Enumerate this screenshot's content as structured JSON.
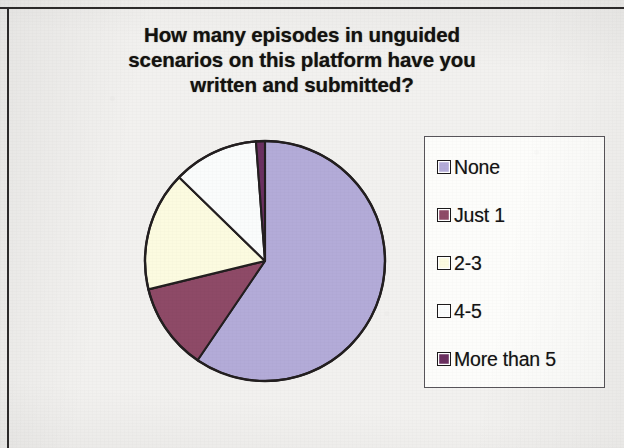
{
  "chart_data": {
    "type": "pie",
    "title": "How many episodes in unguided scenarios on this platform have you written and submitted?",
    "title_lines": [
      "How many episodes in unguided",
      "scenarios on this platform have you",
      "written and submitted?"
    ],
    "categories": [
      "None",
      "Just 1",
      "2-3",
      "4-5",
      "More than 5"
    ],
    "values": [
      59.5,
      11.7,
      16.1,
      11.5,
      1.2
    ],
    "value_unit": "percent",
    "slice_colors": [
      "#b3abd8",
      "#8e4a67",
      "#fcfbe0",
      "#fafcfc",
      "#6b3060"
    ],
    "start_angle_deg": 0,
    "direction": "clockwise",
    "legend_position": "right",
    "grid": false,
    "data_labels": false,
    "xlabel": "",
    "ylabel": ""
  },
  "legend": {
    "entries": [
      {
        "label": "None",
        "color": "#b3abd8"
      },
      {
        "label": "Just 1",
        "color": "#8e4a67"
      },
      {
        "label": "2-3",
        "color": "#fcfbe0"
      },
      {
        "label": "4-5",
        "color": "#fafcfc"
      },
      {
        "label": "More than 5",
        "color": "#6b3060"
      }
    ]
  },
  "style": {
    "background": "#f2f1ef",
    "frame_color": "#2e2c2c",
    "slice_outline": "#231f20",
    "legend_background": "#fdfdfb",
    "legend_border": "#58555a",
    "text_color": "#14120f"
  },
  "geometry": {
    "center_x": 265,
    "center_y": 261,
    "radius": 120
  }
}
